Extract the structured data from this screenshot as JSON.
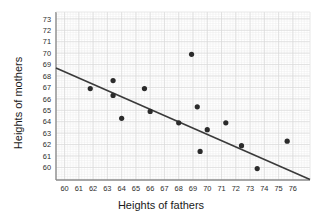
{
  "chart_data": {
    "type": "scatter",
    "title": "",
    "xlabel": "Heights of fathers",
    "ylabel": "Heights of mothers",
    "xlim": [
      59.4,
      77.2
    ],
    "ylim": [
      58.9,
      73.6
    ],
    "xticks": [
      60,
      61,
      62,
      63,
      64,
      65,
      66,
      67,
      68,
      69,
      70,
      71,
      72,
      73,
      74,
      75,
      76
    ],
    "yticks": [
      60,
      61,
      62,
      63,
      64,
      65,
      66,
      67,
      68,
      69,
      70,
      71,
      72,
      73
    ],
    "grid": true,
    "grid_minor": true,
    "legend": "none",
    "marker_color": "#2b2b2b",
    "line_color": "#3a3a3a",
    "grid_color": "#d8d8d8",
    "grid_minor_color": "#ececec",
    "axis_color": "#8a8a8a",
    "points": [
      {
        "x": 61.8,
        "y": 66.9
      },
      {
        "x": 63.4,
        "y": 67.6
      },
      {
        "x": 63.4,
        "y": 66.3
      },
      {
        "x": 64.0,
        "y": 64.3
      },
      {
        "x": 65.6,
        "y": 66.9
      },
      {
        "x": 66.0,
        "y": 64.9
      },
      {
        "x": 68.0,
        "y": 63.9
      },
      {
        "x": 68.9,
        "y": 69.9
      },
      {
        "x": 69.3,
        "y": 65.3
      },
      {
        "x": 69.5,
        "y": 61.4
      },
      {
        "x": 70.0,
        "y": 63.3
      },
      {
        "x": 71.3,
        "y": 63.9
      },
      {
        "x": 72.4,
        "y": 61.9
      },
      {
        "x": 73.5,
        "y": 59.9
      },
      {
        "x": 75.6,
        "y": 62.3
      }
    ],
    "trend_line": {
      "x1": 59.4,
      "y1": 68.7,
      "x2": 77.2,
      "y2": 58.95
    }
  }
}
